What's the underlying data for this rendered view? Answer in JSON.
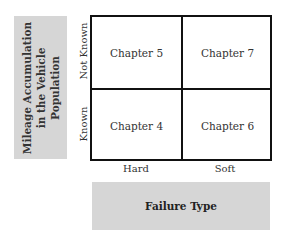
{
  "y_axis": {
    "title": "Mileage Accumulation in the Vehicle Population",
    "categories": [
      "Not Known",
      "Known"
    ]
  },
  "x_axis": {
    "title": "Failure Type",
    "categories": [
      "Hard",
      "Soft"
    ]
  },
  "cells": {
    "not_known_hard": "Chapter 5",
    "not_known_soft": "Chapter 7",
    "known_hard": "Chapter 4",
    "known_soft": "Chapter 6"
  },
  "colors": {
    "label_box": "#d6d6d6",
    "grid_line": "#111111"
  }
}
